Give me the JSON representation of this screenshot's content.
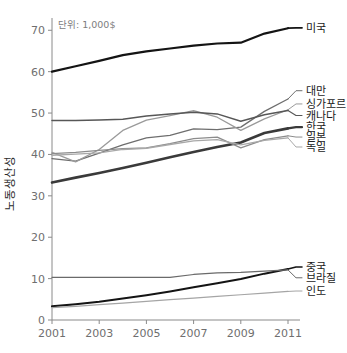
{
  "chart_data": {
    "type": "line",
    "title": "",
    "subtitle": "",
    "unit_note": "단위: 1,000$",
    "xlabel": "",
    "ylabel": "노동생산성",
    "xlim": [
      2001,
      2011
    ],
    "ylim": [
      0,
      72
    ],
    "grid": false,
    "legend_position": "right-inline",
    "x": [
      2001,
      2002,
      2003,
      2004,
      2005,
      2006,
      2007,
      2008,
      2009,
      2010,
      2011
    ],
    "xticks": [
      "2001",
      "2003",
      "2005",
      "2007",
      "2009",
      "2011"
    ],
    "xtick_values": [
      2001,
      2003,
      2005,
      2007,
      2009,
      2011
    ],
    "yticks": [
      "0",
      "10",
      "20",
      "30",
      "40",
      "50",
      "60",
      "70"
    ],
    "ytick_values": [
      0,
      10,
      20,
      30,
      40,
      50,
      60,
      70
    ],
    "series": [
      {
        "name": "미국",
        "color": "#141414",
        "width": 2.2,
        "label_y": 70.6,
        "values": [
          60.0,
          61.3,
          62.6,
          64.0,
          64.9,
          65.6,
          66.3,
          66.8,
          67.0,
          69.2,
          70.5
        ]
      },
      {
        "name": "대만",
        "color": "#6e6e6e",
        "width": 1.3,
        "label_y": 55.4,
        "values": [
          39.0,
          38.4,
          40.3,
          42.3,
          44.0,
          44.6,
          46.2,
          46.0,
          46.6,
          50.4,
          53.4
        ]
      },
      {
        "name": "싱가포르",
        "color": "#9a9a9a",
        "width": 1.3,
        "label_y": 52.2,
        "values": [
          40.5,
          38.2,
          41.2,
          45.8,
          48.3,
          49.4,
          50.6,
          49.0,
          45.8,
          48.6,
          50.8
        ]
      },
      {
        "name": "캐나다",
        "color": "#575757",
        "width": 1.5,
        "label_y": 49.4,
        "values": [
          48.2,
          48.2,
          48.3,
          48.5,
          49.3,
          49.8,
          50.2,
          49.8,
          48.0,
          49.6,
          50.6
        ]
      },
      {
        "name": "한국",
        "color": "#3a3a3a",
        "width": 2.6,
        "label_y": 46.6,
        "values": [
          33.2,
          34.4,
          35.5,
          36.7,
          38.0,
          39.3,
          40.6,
          41.8,
          42.9,
          45.2,
          46.3
        ]
      },
      {
        "name": "일본",
        "color": "#8c8c8c",
        "width": 1.3,
        "label_y": 44.2,
        "values": [
          40.2,
          40.5,
          41.0,
          41.4,
          41.6,
          42.6,
          43.8,
          44.2,
          41.6,
          43.6,
          44.5
        ]
      },
      {
        "name": "독일",
        "color": "#a8a8a8",
        "width": 1.3,
        "label_y": 41.8,
        "values": [
          39.8,
          40.1,
          40.4,
          41.2,
          41.5,
          42.4,
          43.3,
          43.6,
          42.3,
          43.4,
          44.0
        ]
      },
      {
        "name": "중국",
        "color": "#141414",
        "width": 2.0,
        "label_y": 12.8,
        "values": [
          3.3,
          3.8,
          4.4,
          5.2,
          6.0,
          6.9,
          7.9,
          8.9,
          9.9,
          11.2,
          12.3
        ]
      },
      {
        "name": "브라질",
        "color": "#6a6a6a",
        "width": 1.2,
        "label_y": 10.2,
        "values": [
          10.3,
          10.3,
          10.3,
          10.3,
          10.3,
          10.3,
          11.0,
          11.4,
          11.5,
          11.8,
          12.1
        ]
      },
      {
        "name": "인도",
        "color": "#a5a5a5",
        "width": 1.2,
        "label_y": 7.0,
        "values": [
          3.0,
          3.3,
          3.7,
          4.1,
          4.5,
          4.9,
          5.3,
          5.7,
          6.1,
          6.5,
          6.9
        ]
      }
    ]
  }
}
